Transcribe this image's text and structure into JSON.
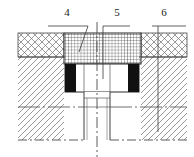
{
  "drawing": {
    "title": "Mould cavity cross-section detail",
    "type": "engineering-cross-section",
    "view": "sectional elevation, symmetric about vertical centre line",
    "canvas": {
      "width": 194,
      "height": 157,
      "background": "#ffffff"
    },
    "callouts": [
      {
        "id": "4",
        "label": "4",
        "text_x": 67,
        "text_y": 16,
        "target": "upper mesh-hatched plate (centre band)",
        "leader": "horizontal shelf then oblique line down into mesh plate"
      },
      {
        "id": "5",
        "label": "5",
        "text_x": 117,
        "text_y": 16,
        "target": "central white cavity / insert",
        "leader": "horizontal shelf then vertical line down to cavity"
      },
      {
        "id": "6",
        "label": "6",
        "text_x": 164,
        "text_y": 16,
        "target": "right cross-hatched body",
        "leader": "horizontal shelf then long vertical line down right side"
      }
    ],
    "regions": [
      {
        "name": "left-crosshatch-band",
        "hatch": "cross-hatch",
        "x": 18,
        "y": 33,
        "w": 46,
        "h": 24
      },
      {
        "name": "right-crosshatch-band",
        "hatch": "cross-hatch",
        "x": 141,
        "y": 33,
        "w": 46,
        "h": 24
      },
      {
        "name": "upper-mesh-plate",
        "hatch": "fine-grid-mesh",
        "x": 64,
        "y": 33,
        "w": 77,
        "h": 31
      },
      {
        "name": "left-diagonal-body",
        "hatch": "diagonal-45",
        "x": 18,
        "y": 57,
        "w": 46,
        "h": 83
      },
      {
        "name": "right-diagonal-body",
        "hatch": "diagonal-45",
        "x": 141,
        "y": 57,
        "w": 46,
        "h": 83
      },
      {
        "name": "left-black-block",
        "hatch": "solid-black",
        "x": 65,
        "y": 64,
        "w": 11,
        "h": 28
      },
      {
        "name": "right-black-block",
        "hatch": "solid-black",
        "x": 128,
        "y": 64,
        "w": 11,
        "h": 28
      },
      {
        "name": "central-cavity",
        "hatch": "none-white",
        "x": 76,
        "y": 64,
        "w": 52,
        "h": 28
      },
      {
        "name": "lower-bore-channel",
        "hatch": "none-white",
        "x": 84,
        "y": 92,
        "w": 26,
        "h": 48
      }
    ],
    "lines": {
      "centre_line_x": 97,
      "centre_line_style": "dash-dot",
      "bottom_edge_style": "dash-dot",
      "horizontal_break_y": 107,
      "bottom_edge_y": 140
    },
    "colors": {
      "ink": "#1a1a1a",
      "hatch": "#6b6b6b",
      "solid_fill": "#111111",
      "paper": "#ffffff",
      "thin_rule": "#555555"
    }
  }
}
